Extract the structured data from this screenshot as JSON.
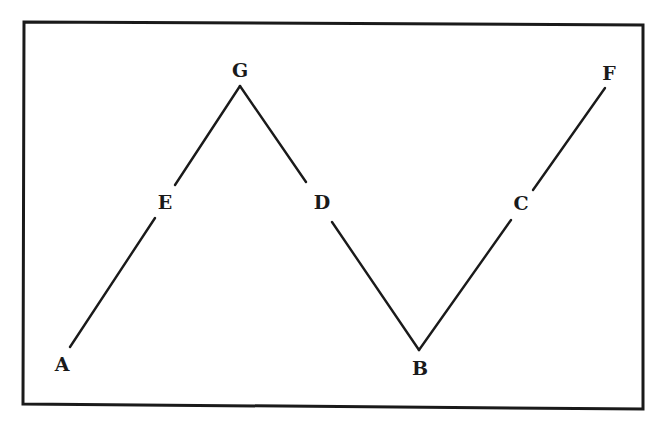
{
  "diagram": {
    "type": "zigzag-line",
    "frame": {
      "x1": 24,
      "y1": 22,
      "x2": 643,
      "y2": 408
    },
    "stroke_color": "#1a1a1a",
    "points": [
      {
        "id": "A",
        "label": "A",
        "x": 62,
        "y": 364
      },
      {
        "id": "E",
        "label": "E",
        "x": 165,
        "y": 202
      },
      {
        "id": "G",
        "label": "G",
        "x": 240,
        "y": 70
      },
      {
        "id": "D",
        "label": "D",
        "x": 322,
        "y": 202
      },
      {
        "id": "B",
        "label": "B",
        "x": 420,
        "y": 368
      },
      {
        "id": "C",
        "label": "C",
        "x": 521,
        "y": 203
      },
      {
        "id": "F",
        "label": "F",
        "x": 609,
        "y": 73
      }
    ],
    "segments": [
      {
        "from": "A",
        "to": "E"
      },
      {
        "from": "E",
        "to": "G"
      },
      {
        "from": "G",
        "to": "D"
      },
      {
        "from": "D",
        "to": "B"
      },
      {
        "from": "B",
        "to": "C"
      },
      {
        "from": "C",
        "to": "F"
      }
    ],
    "path_order": [
      "A",
      "E",
      "G",
      "D",
      "B",
      "C",
      "F"
    ]
  }
}
